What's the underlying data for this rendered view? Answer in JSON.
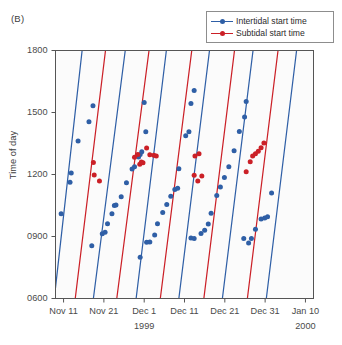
{
  "panel": {
    "label": "(B)"
  },
  "legend": {
    "position": "top-right",
    "items": [
      {
        "label": "Intertidal start time",
        "color": "#2f5fa6",
        "marker": "circle"
      },
      {
        "label": "Subtidal start time",
        "color": "#cb2027",
        "marker": "circle"
      }
    ]
  },
  "colors": {
    "intertidal": "#2f5fa6",
    "subtidal": "#cb2027",
    "axis": "#555555",
    "plot_background": "#fbfbfb",
    "text": "#3d3d3d"
  },
  "chart_data": {
    "type": "scatter",
    "title": "",
    "subtitle": "",
    "xlabel": "",
    "ylabel": "Time of day",
    "grid": false,
    "legend_position": "top-right",
    "x_axis": {
      "label": "",
      "tick_labels": [
        "Nov 11",
        "Nov 21",
        "Dec 1",
        "Dec 11",
        "Dec 21",
        "Dec 31",
        "Jan 10"
      ],
      "tick_days": [
        0,
        10,
        20,
        30,
        40,
        50,
        60
      ],
      "range_days": [
        -2,
        62
      ],
      "year_annotations": [
        {
          "text": "1999",
          "at_tick": "Dec 1"
        },
        {
          "text": "2000",
          "at_tick": "Jan 10"
        }
      ]
    },
    "y_axis": {
      "label": "Time of day",
      "tick_labels": [
        "0600",
        "0900",
        "1200",
        "1500",
        "1800"
      ],
      "tick_values": [
        600,
        900,
        1200,
        1500,
        1800
      ],
      "ylim": [
        600,
        1800
      ]
    },
    "series": [
      {
        "name": "Intertidal start time",
        "color": "#2f5fa6",
        "marker": "circle",
        "points": [
          {
            "x": -0.6,
            "y": 1010
          },
          {
            "x": 1.6,
            "y": 1163
          },
          {
            "x": 1.9,
            "y": 1207
          },
          {
            "x": 3.6,
            "y": 1362
          },
          {
            "x": 6.3,
            "y": 1455
          },
          {
            "x": 7.3,
            "y": 1533
          },
          {
            "x": 7.0,
            "y": 855
          },
          {
            "x": 9.6,
            "y": 913
          },
          {
            "x": 10.3,
            "y": 920
          },
          {
            "x": 10.9,
            "y": 962
          },
          {
            "x": 12.0,
            "y": 1010
          },
          {
            "x": 12.6,
            "y": 1050
          },
          {
            "x": 13.0,
            "y": 1053
          },
          {
            "x": 14.3,
            "y": 1092
          },
          {
            "x": 15.6,
            "y": 1160
          },
          {
            "x": 17.0,
            "y": 1227
          },
          {
            "x": 17.6,
            "y": 1238
          },
          {
            "x": 18.6,
            "y": 1285
          },
          {
            "x": 19.0,
            "y": 1297
          },
          {
            "x": 19.4,
            "y": 1310
          },
          {
            "x": 20.4,
            "y": 1407
          },
          {
            "x": 20.0,
            "y": 1548
          },
          {
            "x": 19.0,
            "y": 800
          },
          {
            "x": 20.6,
            "y": 872
          },
          {
            "x": 21.4,
            "y": 873
          },
          {
            "x": 22.6,
            "y": 907
          },
          {
            "x": 23.3,
            "y": 962
          },
          {
            "x": 24.6,
            "y": 1016
          },
          {
            "x": 25.6,
            "y": 1055
          },
          {
            "x": 26.6,
            "y": 1095
          },
          {
            "x": 27.6,
            "y": 1128
          },
          {
            "x": 28.3,
            "y": 1133
          },
          {
            "x": 28.6,
            "y": 1228
          },
          {
            "x": 30.3,
            "y": 1387
          },
          {
            "x": 31.1,
            "y": 1407
          },
          {
            "x": 31.6,
            "y": 1543
          },
          {
            "x": 32.4,
            "y": 1607
          },
          {
            "x": 31.6,
            "y": 893
          },
          {
            "x": 32.4,
            "y": 890
          },
          {
            "x": 34.1,
            "y": 915
          },
          {
            "x": 35.0,
            "y": 930
          },
          {
            "x": 35.9,
            "y": 960
          },
          {
            "x": 36.6,
            "y": 1013
          },
          {
            "x": 38.0,
            "y": 1098
          },
          {
            "x": 38.9,
            "y": 1140
          },
          {
            "x": 39.9,
            "y": 1185
          },
          {
            "x": 41.0,
            "y": 1238
          },
          {
            "x": 42.3,
            "y": 1315
          },
          {
            "x": 43.6,
            "y": 1408
          },
          {
            "x": 44.9,
            "y": 1478
          },
          {
            "x": 45.3,
            "y": 1553
          },
          {
            "x": 44.7,
            "y": 890
          },
          {
            "x": 45.9,
            "y": 868
          },
          {
            "x": 46.6,
            "y": 890
          },
          {
            "x": 47.6,
            "y": 935
          },
          {
            "x": 49.0,
            "y": 985
          },
          {
            "x": 49.9,
            "y": 990
          },
          {
            "x": 50.6,
            "y": 995
          },
          {
            "x": 51.6,
            "y": 1110
          }
        ]
      },
      {
        "name": "Subtidal start time",
        "color": "#cb2027",
        "marker": "circle",
        "points": [
          {
            "x": 7.4,
            "y": 1258
          },
          {
            "x": 7.6,
            "y": 1197
          },
          {
            "x": 8.9,
            "y": 1168
          },
          {
            "x": 17.6,
            "y": 1283
          },
          {
            "x": 18.4,
            "y": 1297
          },
          {
            "x": 18.9,
            "y": 1250
          },
          {
            "x": 19.3,
            "y": 1260
          },
          {
            "x": 19.7,
            "y": 1257
          },
          {
            "x": 20.6,
            "y": 1328
          },
          {
            "x": 21.4,
            "y": 1295
          },
          {
            "x": 22.4,
            "y": 1293
          },
          {
            "x": 23.0,
            "y": 1290
          },
          {
            "x": 32.6,
            "y": 1290
          },
          {
            "x": 33.6,
            "y": 1300
          },
          {
            "x": 32.4,
            "y": 1196
          },
          {
            "x": 33.3,
            "y": 1168
          },
          {
            "x": 34.3,
            "y": 1193
          },
          {
            "x": 45.3,
            "y": 1213
          },
          {
            "x": 46.3,
            "y": 1262
          },
          {
            "x": 46.9,
            "y": 1290
          },
          {
            "x": 47.6,
            "y": 1300
          },
          {
            "x": 48.3,
            "y": 1313
          },
          {
            "x": 49.0,
            "y": 1330
          },
          {
            "x": 49.7,
            "y": 1352
          }
        ]
      }
    ],
    "trend_lines": [
      {
        "series": "Intertidal start time",
        "color": "#2f5fa6",
        "x_at_ymin": -2.3,
        "x_at_ymax": 4.6
      },
      {
        "series": "Subtidal start time",
        "color": "#cb2027",
        "x_at_ymin": 2.9,
        "x_at_ymax": 10.4
      },
      {
        "series": "Intertidal start time",
        "color": "#2f5fa6",
        "x_at_ymin": 7.4,
        "x_at_ymax": 15.3
      },
      {
        "series": "Subtidal start time",
        "color": "#cb2027",
        "x_at_ymin": 13.2,
        "x_at_ymax": 21.2
      },
      {
        "series": "Intertidal start time",
        "color": "#2f5fa6",
        "x_at_ymin": 18.0,
        "x_at_ymax": 25.5
      },
      {
        "series": "Subtidal start time",
        "color": "#cb2027",
        "x_at_ymin": 24.0,
        "x_at_ymax": 31.8
      },
      {
        "series": "Intertidal start time",
        "color": "#2f5fa6",
        "x_at_ymin": 28.6,
        "x_at_ymax": 36.2
      },
      {
        "series": "Subtidal start time",
        "color": "#cb2027",
        "x_at_ymin": 34.8,
        "x_at_ymax": 42.4
      },
      {
        "series": "Intertidal start time",
        "color": "#2f5fa6",
        "x_at_ymin": 39.4,
        "x_at_ymax": 47.0
      },
      {
        "series": "Subtidal start time",
        "color": "#cb2027",
        "x_at_ymin": 45.6,
        "x_at_ymax": 53.2
      },
      {
        "series": "Intertidal start time",
        "color": "#2f5fa6",
        "x_at_ymin": 50.3,
        "x_at_ymax": 57.8
      }
    ]
  }
}
